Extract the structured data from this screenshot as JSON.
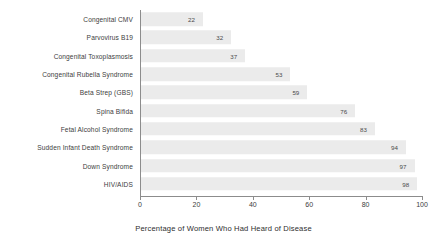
{
  "chart_data": {
    "type": "bar",
    "orientation": "horizontal",
    "title": "",
    "xlabel": "Percentage of Women Who Had Heard of Disease",
    "ylabel": "",
    "categories": [
      "Congenital CMV",
      "Parvovirus B19",
      "Congenital Toxoplasmosis",
      "Congenital Rubella Syndrome",
      "Beta Strep (GBS)",
      "Spina Bifida",
      "Fetal Alcohol Syndrome",
      "Sudden Infant Death Syndrome",
      "Down Syndrome",
      "HIV/AIDS"
    ],
    "values": [
      22,
      32,
      37,
      53,
      59,
      76,
      83,
      94,
      97,
      98
    ],
    "data_labels": [
      "22",
      "32",
      "37",
      "53",
      "59",
      "76",
      "83",
      "94",
      "97",
      "98"
    ],
    "xlim": [
      0,
      100
    ],
    "xticks": [
      0,
      20,
      40,
      60,
      80,
      100
    ],
    "xtick_labels": [
      "0",
      "20",
      "40",
      "60",
      "80",
      "100"
    ],
    "grid": false,
    "legend": null,
    "bar_color": "#ebebeb",
    "axis_color": "#8c8c8c",
    "text_color": "#3d3d3d"
  }
}
